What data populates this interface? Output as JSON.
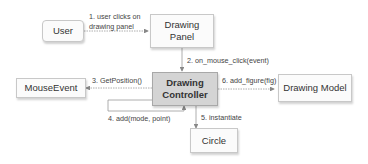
{
  "diagram": {
    "nodes": {
      "user": "User",
      "drawing_panel": "Drawing Panel",
      "drawing_controller": "Drawing Controller",
      "mouse_event": "MouseEvent",
      "drawing_model": "Drawing Model",
      "circle": "Circle"
    },
    "edges": {
      "e1_line1": "1. user clicks on",
      "e1_line2": "drawing panel",
      "e2": "2. on_mouse_click(event)",
      "e3": "3. GetPosition()",
      "e4": "4. add(mode, point)",
      "e5": "5. instantiate",
      "e6": "6. add_figure(fig)"
    },
    "colors": {
      "box_border": "#c8c8c8",
      "box_fill": "#fbfbfb",
      "controller_fill": "#d4d4d4",
      "arrow": "#888888"
    }
  }
}
